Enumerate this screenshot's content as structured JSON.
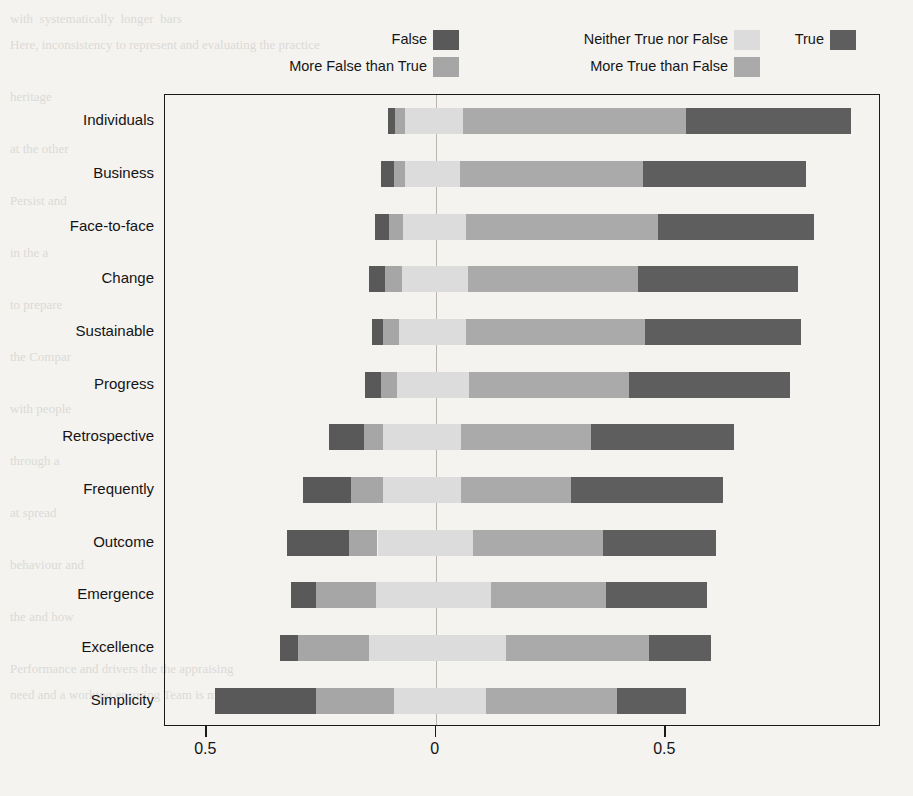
{
  "legend": {
    "columns": [
      {
        "items": [
          {
            "label": "False",
            "key": "false"
          },
          {
            "label": "More False than True",
            "key": "more_false"
          }
        ]
      },
      {
        "items": [
          {
            "label": "Neither True nor False",
            "key": "neither"
          },
          {
            "label": "More True than False",
            "key": "more_true"
          }
        ]
      },
      {
        "items": [
          {
            "label": "True",
            "key": "true"
          }
        ]
      }
    ]
  },
  "colors": {
    "false": "#595959",
    "more_false": "#a6a6a6",
    "neither": "#dcdcdc",
    "more_true": "#aaaaaa",
    "true": "#5e5e5e",
    "axis": "#1a1a1a",
    "zero_line": "#b9b6b0",
    "background": "#f4f3f0"
  },
  "axes": {
    "x_ticks": [
      {
        "value": -0.5,
        "label": "0.5"
      },
      {
        "value": 0.0,
        "label": "0"
      },
      {
        "value": 0.5,
        "label": "0.5"
      }
    ],
    "x_min": -0.59,
    "x_max": 0.97,
    "x_label": "",
    "y_label": "",
    "grid": false
  },
  "chart_data": {
    "type": "bar",
    "subtype": "diverging-stacked-likert",
    "title": "",
    "xlabel": "",
    "ylabel": "",
    "xlim": [
      -0.59,
      0.97
    ],
    "grid": false,
    "legend_position": "top",
    "categories": [
      "Individuals",
      "Business",
      "Face-to-face",
      "Change",
      "Sustainable",
      "Progress",
      "Retrospective",
      "Frequently",
      "Outcome",
      "Emergence",
      "Excellence",
      "Simplicity"
    ],
    "series": [
      {
        "name": "False",
        "key": "false",
        "values": [
          0.015,
          0.03,
          0.03,
          0.035,
          0.024,
          0.035,
          0.076,
          0.105,
          0.135,
          0.055,
          0.039,
          0.22
        ]
      },
      {
        "name": "More False than True",
        "key": "more_false",
        "values": [
          0.022,
          0.022,
          0.03,
          0.037,
          0.035,
          0.035,
          0.04,
          0.07,
          0.063,
          0.13,
          0.155,
          0.17
        ]
      },
      {
        "name": "Neither True nor False",
        "key": "neither",
        "values": [
          0.127,
          0.12,
          0.137,
          0.143,
          0.146,
          0.157,
          0.17,
          0.17,
          0.207,
          0.25,
          0.3,
          0.2
        ]
      },
      {
        "name": "More True than False",
        "key": "more_true",
        "values": [
          0.485,
          0.4,
          0.42,
          0.37,
          0.39,
          0.35,
          0.285,
          0.24,
          0.285,
          0.25,
          0.31,
          0.285
        ]
      },
      {
        "name": "True",
        "key": "true",
        "values": [
          0.36,
          0.355,
          0.34,
          0.35,
          0.34,
          0.35,
          0.31,
          0.33,
          0.245,
          0.22,
          0.135,
          0.15
        ]
      }
    ],
    "bar_starts": [
      -0.104,
      -0.12,
      -0.132,
      -0.145,
      -0.14,
      -0.155,
      -0.232,
      -0.29,
      -0.325,
      -0.315,
      -0.34,
      -0.48
    ]
  },
  "ghost_text": "with  systematically  longer  bars\nHere, inconsistency to represent and evaluating the practice\n\nheritage\n\nat the other\n\nPersist and\n\nin the a\n\nto prepare\n\nthe Compar\n\nwith people\n\nthrough a\n\nat spread\n\nbehaviour and\n\nthe and how\n\nPerformance and drivers the the appraising\nneed and a working ensuring Team is meeting"
}
